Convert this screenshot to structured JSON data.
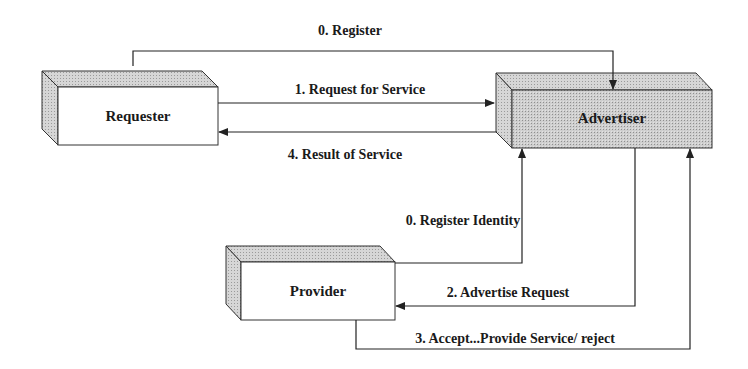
{
  "diagram": {
    "nodes": {
      "requester": {
        "label": "Requester",
        "fill": "#ffffff",
        "shade": "#c8c8c8"
      },
      "advertiser": {
        "label": "Advertiser",
        "fill": "#d0d0d0",
        "shade": "#c0c0c0"
      },
      "provider": {
        "label": "Provider",
        "fill": "#ffffff",
        "shade": "#c8c8c8"
      }
    },
    "edges": {
      "register": {
        "label": "0. Register",
        "from": "Requester",
        "to": "Advertiser"
      },
      "request": {
        "label": "1. Request for Service",
        "from": "Requester",
        "to": "Advertiser"
      },
      "result": {
        "label": "4. Result of Service",
        "from": "Advertiser",
        "to": "Requester"
      },
      "register_identity": {
        "label": "0. Register Identity",
        "from": "Provider",
        "to": "Advertiser"
      },
      "advertise": {
        "label": "2. Advertise Request",
        "from": "Advertiser",
        "to": "Provider"
      },
      "accept": {
        "label": "3. Accept...Provide Service/ reject",
        "from": "Provider",
        "to": "Advertiser"
      }
    },
    "colors": {
      "line": "#222222",
      "text": "#1a1a1a"
    }
  }
}
